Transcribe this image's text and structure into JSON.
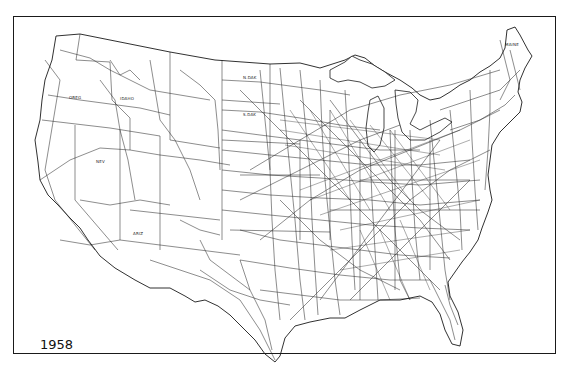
{
  "map": {
    "title": "United States railroad network",
    "year_label": "1958",
    "colors": {
      "background": "#ffffff",
      "ink": "#1a1a1a"
    },
    "state_labels": [
      {
        "text": "OREG",
        "x": 69,
        "y": 99
      },
      {
        "text": "IDAHO",
        "x": 120,
        "y": 100
      },
      {
        "text": "N.DAK",
        "x": 243,
        "y": 79
      },
      {
        "text": "S.DAK",
        "x": 243,
        "y": 116
      },
      {
        "text": "NEV",
        "x": 96,
        "y": 163
      },
      {
        "text": "ARIZ",
        "x": 133,
        "y": 235
      },
      {
        "text": "MAINE",
        "x": 505,
        "y": 46
      }
    ]
  }
}
